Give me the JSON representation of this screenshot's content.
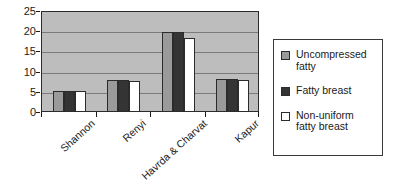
{
  "chart_data": {
    "type": "bar",
    "title": "",
    "subtitle": "",
    "xlabel": "",
    "ylabel": "",
    "categories": [
      "Shannon",
      "Renyi",
      "Havrda & Charvat",
      "Kapur"
    ],
    "series": [
      {
        "name": "Uncompressed fatty",
        "color": "#9a9a9a",
        "values": [
          5.0,
          7.6,
          19.5,
          8.0
        ]
      },
      {
        "name": "Fatty breast",
        "color": "#343434",
        "values": [
          5.0,
          7.6,
          19.5,
          8.0
        ]
      },
      {
        "name": "Non-uniform fatty breast",
        "color": "#ffffff",
        "values": [
          4.9,
          7.5,
          18.1,
          7.8
        ]
      }
    ],
    "ylim": [
      0,
      25
    ],
    "yticks": [
      0,
      5,
      10,
      15,
      20,
      25
    ],
    "ytick_labels": [
      "0",
      "5",
      "10",
      "15",
      "20",
      "25"
    ],
    "grid": true,
    "grid_axis": "y",
    "legend_position": "right",
    "plot_background": "#bdbdbd",
    "axis_color": "#2b2b2b",
    "gridline_color": "#7b7b7b",
    "xtick_label_rotation": -42
  },
  "legend": {
    "entries": [
      {
        "label": "Uncompressed fatty",
        "swatch": "#9a9a9a"
      },
      {
        "label": "Fatty breast",
        "swatch": "#343434"
      },
      {
        "label": "Non-uniform fatty breast",
        "swatch": "#ffffff"
      }
    ]
  }
}
